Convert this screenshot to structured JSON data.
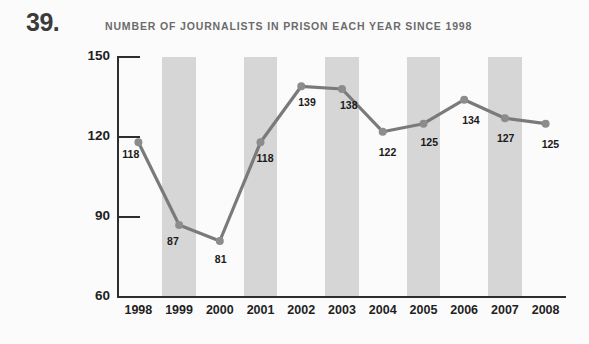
{
  "figure_number": "39.",
  "chart_data": {
    "type": "line",
    "title": "NUMBER OF JOURNALISTS IN PRISON EACH YEAR SINCE 1998",
    "xlabel": "",
    "ylabel": "",
    "categories": [
      "1998",
      "1999",
      "2000",
      "2001",
      "2002",
      "2003",
      "2004",
      "2005",
      "2006",
      "2007",
      "2008"
    ],
    "values": [
      118,
      87,
      81,
      118,
      139,
      138,
      122,
      125,
      134,
      127,
      125
    ],
    "ylim": [
      60,
      150
    ],
    "yticks": [
      60,
      90,
      120,
      150
    ],
    "ytick_labels": [
      "60",
      "90",
      "120",
      "150"
    ],
    "grid": false,
    "legend": false,
    "banded_columns": [
      "1999",
      "2001",
      "2003",
      "2005",
      "2007"
    ],
    "colors": {
      "line": "#7a7a7a",
      "marker": "#8c8c8c",
      "band": "#d6d6d6",
      "axis": "#2e2e2e",
      "title": "#6b6b6b",
      "label": "#1a1a1a",
      "background": "#fbfbfb"
    }
  }
}
